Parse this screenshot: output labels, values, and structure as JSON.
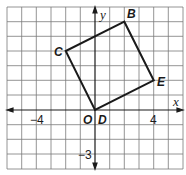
{
  "diagram": {
    "type": "coordinate-plane",
    "axes": {
      "x_label": "x",
      "y_label": "y"
    },
    "origin_label": "O",
    "tick_labels": [
      {
        "id": "x_neg4",
        "text": "−4"
      },
      {
        "id": "x_4",
        "text": "4"
      },
      {
        "id": "y_neg3",
        "text": "−3"
      }
    ],
    "polygon": {
      "vertices": [
        {
          "label": "B",
          "x": 2,
          "y": 6
        },
        {
          "label": "C",
          "x": -2,
          "y": 4
        },
        {
          "label": "D",
          "x": 0,
          "y": 0
        },
        {
          "label": "E",
          "x": 4,
          "y": 2
        }
      ]
    },
    "colors": {
      "grid": "#6b6b6b",
      "stroke": "#1a1a1a",
      "background": "#ffffff"
    }
  }
}
